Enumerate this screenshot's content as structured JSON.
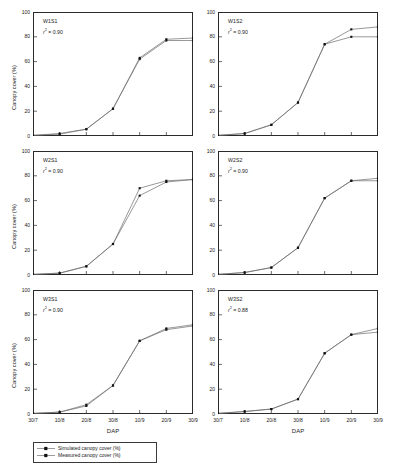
{
  "figure": {
    "axis_title_x": "DAP",
    "axis_title_y": "Canopy cover (%)"
  },
  "legend": {
    "items": [
      {
        "label": "Simulated canopy cover (%)",
        "marker": "line-marker-icon"
      },
      {
        "label": "Measured canopy cover (%)",
        "marker": "line-marker-icon"
      }
    ]
  },
  "chart_data": {
    "type": "line",
    "title": "",
    "xlabel": "DAP",
    "ylabel": "Canopy cover (%)",
    "xlim": [
      0,
      6
    ],
    "ylim": [
      0,
      100
    ],
    "yticks": [
      0,
      20,
      40,
      60,
      80,
      100
    ],
    "xticks": [
      "30/7",
      "10/8",
      "20/8",
      "30/8",
      "10/9",
      "20/9",
      "30/9"
    ],
    "grid": false,
    "legend_position": "bottom-left",
    "panels": [
      {
        "id": "W1S1",
        "label": "W1S1",
        "r2_label": "r",
        "r2_sup": "2",
        "r2_value": "= 0.90",
        "row": 0,
        "col": 0,
        "x": [
          0,
          1,
          2,
          3,
          4,
          5,
          6
        ],
        "series": [
          {
            "name": "Simulated canopy cover (%)",
            "values": [
              0.5,
              1.5,
              5.5,
              22,
              62,
              77,
              77
            ]
          },
          {
            "name": "Measured canopy cover (%)",
            "values": [
              0.5,
              2.0,
              5.5,
              22,
              63,
              78,
              79
            ]
          }
        ]
      },
      {
        "id": "W1S2",
        "label": "W1S2",
        "r2_label": "r",
        "r2_sup": "2",
        "r2_value": "= 0.90",
        "row": 0,
        "col": 1,
        "x": [
          0,
          1,
          2,
          3,
          4,
          5,
          6
        ],
        "series": [
          {
            "name": "Simulated canopy cover (%)",
            "values": [
              0.5,
              2,
              9,
              27,
              74,
              86,
              88
            ]
          },
          {
            "name": "Measured canopy cover (%)",
            "values": [
              0.5,
              2,
              9,
              27,
              74,
              80,
              80
            ]
          }
        ]
      },
      {
        "id": "W2S1",
        "label": "W2S1",
        "r2_label": "r",
        "r2_sup": "2",
        "r2_value": "= 0.90",
        "row": 1,
        "col": 0,
        "x": [
          0,
          1,
          2,
          3,
          4,
          5,
          6
        ],
        "series": [
          {
            "name": "Simulated canopy cover (%)",
            "values": [
              0.5,
              1.5,
              7,
              25,
              64,
              75,
              77
            ]
          },
          {
            "name": "Measured canopy cover (%)",
            "values": [
              0.5,
              1.5,
              7,
              25,
              70,
              76,
              77
            ]
          }
        ]
      },
      {
        "id": "W2S2",
        "label": "W2S2",
        "r2_label": "r",
        "r2_sup": "2",
        "r2_value": "= 0.90",
        "row": 1,
        "col": 1,
        "x": [
          0,
          1,
          2,
          3,
          4,
          5,
          6
        ],
        "series": [
          {
            "name": "Simulated canopy cover (%)",
            "values": [
              0.5,
              2,
              6,
              22,
              62,
              76,
              76
            ]
          },
          {
            "name": "Measured canopy cover (%)",
            "values": [
              0.5,
              2,
              6,
              22,
              62,
              76,
              78
            ]
          }
        ]
      },
      {
        "id": "W3S1",
        "label": "W3S1",
        "r2_label": "r",
        "r2_sup": "2",
        "r2_value": "= 0.90",
        "row": 2,
        "col": 0,
        "x": [
          0,
          1,
          2,
          3,
          4,
          5,
          6
        ],
        "series": [
          {
            "name": "Simulated canopy cover (%)",
            "values": [
              0.5,
              1.5,
              6.5,
              23,
              59,
              68,
              71
            ]
          },
          {
            "name": "Measured canopy cover (%)",
            "values": [
              0.5,
              1.5,
              7.5,
              23,
              59,
              69,
              72
            ]
          }
        ]
      },
      {
        "id": "W3S2",
        "label": "W3S2",
        "r2_label": "r",
        "r2_sup": "2",
        "r2_value": "= 0.88",
        "row": 2,
        "col": 1,
        "x": [
          0,
          1,
          2,
          3,
          4,
          5,
          6
        ],
        "series": [
          {
            "name": "Simulated canopy cover (%)",
            "values": [
              0.5,
              2,
              4,
              12,
              49,
              64,
              66
            ]
          },
          {
            "name": "Measured canopy cover (%)",
            "values": [
              0.5,
              2,
              4,
              12,
              49,
              64,
              69
            ]
          }
        ]
      }
    ]
  }
}
